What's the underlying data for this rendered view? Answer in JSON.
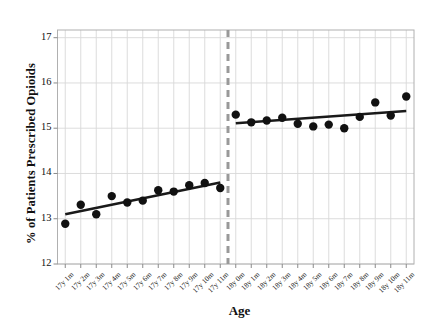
{
  "chart_data": {
    "type": "scatter",
    "title": "",
    "xlabel": "Age",
    "ylabel": "% of Patients Prescribed Opioids",
    "ylim": [
      12,
      17.17
    ],
    "yticks": [
      12,
      13,
      14,
      15,
      16,
      17
    ],
    "ytick_labels": [
      "12",
      "13",
      "14",
      "15",
      "16",
      "17"
    ],
    "grid": true,
    "legend": false,
    "categories": [
      "17y 1m",
      "17y 2m",
      "17y 3m",
      "17y 4m",
      "17y 5m",
      "17y 6m",
      "17y 7m",
      "17y 8m",
      "17y 9m",
      "17y 10m",
      "17y 11m",
      "18y 0m",
      "18y 1m",
      "18y 2m",
      "18y 3m",
      "18y 4m",
      "18y 5m",
      "18y 6m",
      "18y 7m",
      "18y 8m",
      "18y 9m",
      "18y 10m",
      "18y 11m"
    ],
    "values": [
      12.89,
      13.31,
      13.1,
      13.5,
      13.36,
      13.4,
      13.63,
      13.6,
      13.74,
      13.79,
      13.68,
      15.3,
      15.13,
      15.17,
      15.23,
      15.1,
      15.04,
      15.08,
      15.0,
      15.25,
      15.57,
      15.28,
      15.7
    ],
    "marker_color": "#111111",
    "marker_size": 4.2,
    "discontinuity": {
      "after_category": "17y 11m",
      "style": "dashed",
      "color": "#999999",
      "width": 3
    },
    "fit_lines": [
      {
        "segment": "pre",
        "color": "#1a1a1a",
        "width": 2.6,
        "x_start_index": 0,
        "x_end_index": 10,
        "y_start": 13.1,
        "y_end": 13.8
      },
      {
        "segment": "post",
        "color": "#1a1a1a",
        "width": 2.6,
        "x_start_index": 11,
        "x_end_index": 22,
        "y_start": 15.11,
        "y_end": 15.38
      }
    ],
    "axis_color": "#b0b0b0",
    "grid_color": "#d8d8d8"
  }
}
